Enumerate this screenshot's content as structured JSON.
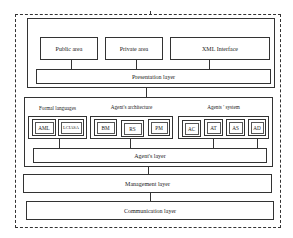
{
  "diagram": {
    "top_section": {
      "modules": [
        {
          "label": "Public area"
        },
        {
          "label": "Private area"
        },
        {
          "label": "XML Interface"
        }
      ],
      "layer": "Presentation layer"
    },
    "agent_section": {
      "groups": [
        {
          "title": "Formal languages",
          "items": [
            "AML",
            "LCIASA"
          ]
        },
        {
          "title": "Agent's architecture",
          "items": [
            "BM",
            "RS",
            "PM"
          ]
        },
        {
          "title": "Agents ' system",
          "items": [
            "AC",
            "AT",
            "AS",
            "AD"
          ]
        }
      ],
      "layer": "Agent's layer"
    },
    "management_layer": "Management layer",
    "communication_layer": "Communication layer"
  }
}
